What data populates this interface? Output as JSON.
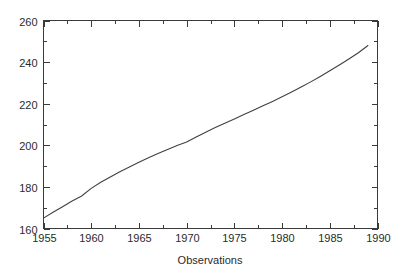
{
  "chart_data": {
    "type": "line",
    "title": "",
    "subtitle": "",
    "xlabel": "Observations",
    "ylabel": "",
    "xlim": [
      1955,
      1990
    ],
    "ylim": [
      160,
      260
    ],
    "grid": false,
    "legend": null,
    "x_major_ticks": [
      1955,
      1960,
      1965,
      1970,
      1975,
      1980,
      1985,
      1990
    ],
    "x_tick_labels": [
      "1955",
      "1960",
      "1965",
      "1970",
      "1975",
      "1980",
      "1985",
      "1990"
    ],
    "x_minor_tick_interval": 2.5,
    "y_major_ticks": [
      160,
      180,
      200,
      220,
      240,
      260
    ],
    "y_tick_labels": [
      "160",
      "180",
      "200",
      "220",
      "240",
      "260"
    ],
    "y_minor_tick_interval": 10,
    "series": [
      {
        "name": "observations",
        "color": "#404040",
        "x": [
          1955,
          1956,
          1957,
          1958,
          1959,
          1960,
          1961,
          1962,
          1963,
          1964,
          1965,
          1966,
          1967,
          1968,
          1969,
          1970,
          1971,
          1972,
          1973,
          1974,
          1975,
          1976,
          1977,
          1978,
          1979,
          1980,
          1981,
          1982,
          1983,
          1984,
          1985,
          1986,
          1987,
          1988,
          1989
        ],
        "values": [
          165.0,
          167.8,
          170.5,
          173.2,
          175.6,
          179.3,
          182.2,
          184.8,
          187.3,
          189.6,
          191.8,
          194.0,
          196.0,
          198.0,
          199.9,
          201.6,
          204.0,
          206.3,
          208.5,
          210.6,
          212.7,
          214.8,
          216.9,
          219.0,
          221.1,
          223.3,
          225.6,
          228.0,
          230.5,
          233.1,
          235.8,
          238.6,
          241.5,
          244.5,
          248.0
        ]
      }
    ]
  },
  "figure": {
    "background_color": "#ffffff",
    "axis_color": "#3a3a3a",
    "text_color": "#2b2b2b"
  }
}
